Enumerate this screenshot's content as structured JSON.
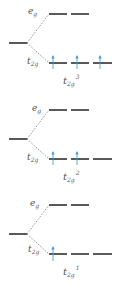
{
  "colors": {
    "level": "#222222",
    "dashed": "#777777",
    "arrow": "#4a9cd6",
    "label": "#555555"
  },
  "labels": {
    "eg_base": "e",
    "eg_sub": "g",
    "t2g_base": "t",
    "t2g_sub": "2g"
  },
  "panels": [
    {
      "config_base": "t",
      "config_sub": "2g",
      "config_sup": "3",
      "electrons": 3
    },
    {
      "config_base": "t",
      "config_sub": "2g",
      "config_sup": "2",
      "electrons": 2
    },
    {
      "config_base": "t",
      "config_sub": "2g",
      "config_sup": "1",
      "electrons": 1
    }
  ]
}
